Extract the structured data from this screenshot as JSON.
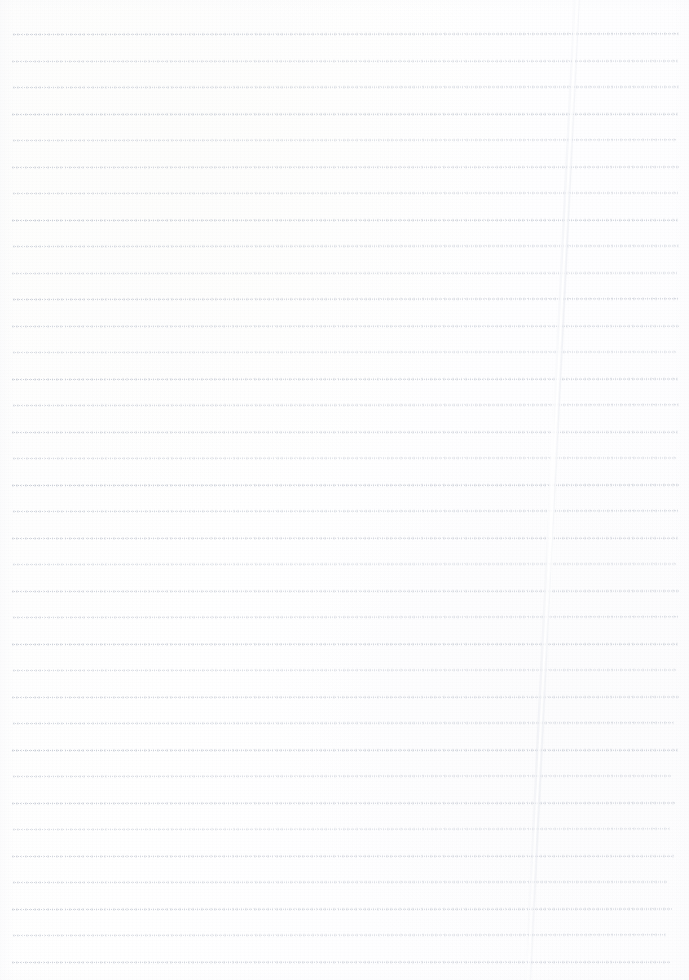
{
  "document": {
    "kind": "scanned-lined-paper",
    "title": "Blank lined notebook page",
    "width": 689,
    "height": 980,
    "has_text": false,
    "content_text": "",
    "background_color": "#fefefe"
  },
  "paper": {
    "base_color": "#fefefe",
    "tint_warm": "#fdfdfc",
    "tint_cool": "#fcfcfd",
    "edge_shadow_color": "#f4f5f8"
  },
  "rules": {
    "count": 36,
    "first_y": 34,
    "spacing": 26.6,
    "left_x": 12,
    "right_x": 678,
    "style": "dotted",
    "dot_period": 2.1,
    "base_color": "#c3c8d2",
    "lines": [
      {
        "y": 34,
        "color": "#c2c7d1",
        "opacity": 0.8,
        "tilt": -0.06,
        "left": 13,
        "right": 679
      },
      {
        "y": 61,
        "color": "#c5cad4",
        "opacity": 0.74,
        "tilt": -0.04,
        "left": 12,
        "right": 678
      },
      {
        "y": 87,
        "color": "#c4c9d3",
        "opacity": 0.78,
        "tilt": -0.05,
        "left": 13,
        "right": 679
      },
      {
        "y": 114,
        "color": "#c1c6d0",
        "opacity": 0.84,
        "tilt": -0.03,
        "left": 12,
        "right": 678
      },
      {
        "y": 140,
        "color": "#c6cbd5",
        "opacity": 0.7,
        "tilt": -0.06,
        "left": 13,
        "right": 677
      },
      {
        "y": 167,
        "color": "#c3c8d2",
        "opacity": 0.79,
        "tilt": -0.04,
        "left": 12,
        "right": 679
      },
      {
        "y": 193,
        "color": "#c5cad3",
        "opacity": 0.73,
        "tilt": -0.05,
        "left": 13,
        "right": 678
      },
      {
        "y": 220,
        "color": "#c0c5cf",
        "opacity": 0.86,
        "tilt": -0.03,
        "left": 12,
        "right": 678
      },
      {
        "y": 246,
        "color": "#c4c9d3",
        "opacity": 0.76,
        "tilt": -0.05,
        "left": 13,
        "right": 679
      },
      {
        "y": 273,
        "color": "#c6cbd5",
        "opacity": 0.71,
        "tilt": -0.04,
        "left": 12,
        "right": 677
      },
      {
        "y": 299,
        "color": "#c2c7d1",
        "opacity": 0.82,
        "tilt": -0.06,
        "left": 13,
        "right": 678
      },
      {
        "y": 326,
        "color": "#c4c9d3",
        "opacity": 0.77,
        "tilt": -0.03,
        "left": 12,
        "right": 679
      },
      {
        "y": 352,
        "color": "#c7ccd6",
        "opacity": 0.68,
        "tilt": -0.05,
        "left": 13,
        "right": 676
      },
      {
        "y": 379,
        "color": "#c1c6d0",
        "opacity": 0.85,
        "tilt": -0.04,
        "left": 12,
        "right": 678
      },
      {
        "y": 405,
        "color": "#c5cad4",
        "opacity": 0.74,
        "tilt": -0.06,
        "left": 13,
        "right": 679
      },
      {
        "y": 432,
        "color": "#c3c8d2",
        "opacity": 0.8,
        "tilt": -0.03,
        "left": 12,
        "right": 678
      },
      {
        "y": 458,
        "color": "#c6cbd5",
        "opacity": 0.7,
        "tilt": -0.05,
        "left": 13,
        "right": 677
      },
      {
        "y": 485,
        "color": "#c0c5cf",
        "opacity": 0.87,
        "tilt": -0.04,
        "left": 12,
        "right": 679
      },
      {
        "y": 511,
        "color": "#c4c9d3",
        "opacity": 0.76,
        "tilt": -0.06,
        "left": 13,
        "right": 678
      },
      {
        "y": 538,
        "color": "#c2c7d1",
        "opacity": 0.81,
        "tilt": -0.03,
        "left": 12,
        "right": 678
      },
      {
        "y": 564,
        "color": "#c7ccd6",
        "opacity": 0.67,
        "tilt": -0.05,
        "left": 13,
        "right": 676
      },
      {
        "y": 591,
        "color": "#c3c8d2",
        "opacity": 0.79,
        "tilt": -0.04,
        "left": 12,
        "right": 679
      },
      {
        "y": 617,
        "color": "#c5cad4",
        "opacity": 0.73,
        "tilt": -0.06,
        "left": 13,
        "right": 678
      },
      {
        "y": 644,
        "color": "#c1c6d0",
        "opacity": 0.84,
        "tilt": -0.03,
        "left": 12,
        "right": 678
      },
      {
        "y": 670,
        "color": "#c6cbd5",
        "opacity": 0.69,
        "tilt": -0.05,
        "left": 13,
        "right": 677
      },
      {
        "y": 697,
        "color": "#c3c8d2",
        "opacity": 0.78,
        "tilt": -0.04,
        "left": 12,
        "right": 679
      },
      {
        "y": 723,
        "color": "#c4c9d3",
        "opacity": 0.75,
        "tilt": -0.06,
        "left": 13,
        "right": 674
      },
      {
        "y": 750,
        "color": "#c0c5cf",
        "opacity": 0.86,
        "tilt": -0.03,
        "left": 12,
        "right": 678
      },
      {
        "y": 776,
        "color": "#c5cad4",
        "opacity": 0.72,
        "tilt": -0.05,
        "left": 13,
        "right": 672
      },
      {
        "y": 803,
        "color": "#c2c7d1",
        "opacity": 0.82,
        "tilt": -0.04,
        "left": 12,
        "right": 676
      },
      {
        "y": 829,
        "color": "#c7ccd6",
        "opacity": 0.66,
        "tilt": -0.06,
        "left": 13,
        "right": 670
      },
      {
        "y": 856,
        "color": "#c3c8d2",
        "opacity": 0.79,
        "tilt": -0.03,
        "left": 12,
        "right": 674
      },
      {
        "y": 882,
        "color": "#c4c9d3",
        "opacity": 0.74,
        "tilt": -0.05,
        "left": 13,
        "right": 668
      },
      {
        "y": 909,
        "color": "#c1c6d0",
        "opacity": 0.83,
        "tilt": -0.04,
        "left": 12,
        "right": 672
      },
      {
        "y": 935,
        "color": "#c5cad4",
        "opacity": 0.71,
        "tilt": -0.06,
        "left": 13,
        "right": 666
      },
      {
        "y": 962,
        "color": "#c2c7d1",
        "opacity": 0.8,
        "tilt": -0.03,
        "left": 12,
        "right": 670
      }
    ]
  },
  "crease": {
    "label": "vertical fold crease",
    "top_x": 577,
    "bottom_x": 528,
    "width": 7,
    "highlight_color": "#ffffff",
    "shadow_color": "#e9ebf0",
    "opacity": 0.9
  }
}
